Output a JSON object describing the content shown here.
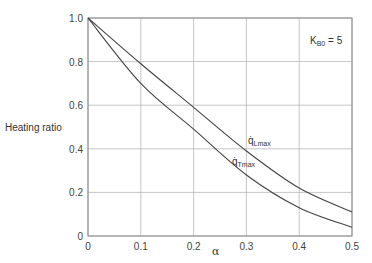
{
  "chart_data": {
    "type": "line",
    "title": "",
    "xlabel": "α",
    "ylabel": "Heating ratio",
    "xlim": [
      0,
      0.5
    ],
    "ylim": [
      0,
      1.0
    ],
    "grid": true,
    "x_ticks": [
      "0",
      "0.1",
      "0.2",
      "0.3",
      "0.4",
      "0.5"
    ],
    "y_ticks": [
      "0",
      "0.2",
      "0.4",
      "0.6",
      "0.8",
      "1.0"
    ],
    "x": [
      0,
      0.1,
      0.2,
      0.3,
      0.4,
      0.5
    ],
    "series": [
      {
        "name": "q̇L max",
        "label_main": "q̇",
        "label_sub": "Lmax",
        "values": [
          1.0,
          0.79,
          0.59,
          0.39,
          0.22,
          0.11
        ]
      },
      {
        "name": "q̇T max",
        "label_main": "q̇",
        "label_sub": "Tmax",
        "values": [
          1.0,
          0.7,
          0.49,
          0.28,
          0.13,
          0.04
        ]
      }
    ],
    "annotations": [
      {
        "text": "K",
        "sub": "B0",
        "suffix": " = 5"
      }
    ],
    "legend": "inline labels on curves"
  }
}
